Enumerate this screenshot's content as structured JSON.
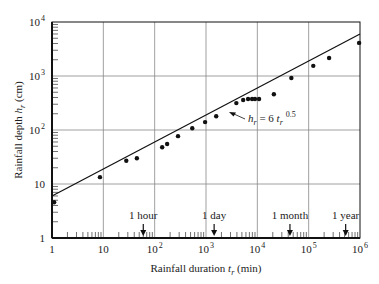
{
  "chart_data": {
    "type": "scatter",
    "title": "",
    "xlabel": "Rainfall duration t_r (min)",
    "ylabel": "Rainfall depth h_r (cm)",
    "xscale": "log",
    "yscale": "log",
    "xlim": [
      1,
      1000000
    ],
    "ylim": [
      1,
      10000
    ],
    "grid": true,
    "x_tick_labels": [
      "1",
      "10",
      "10^2",
      "10^3",
      "10^4",
      "10^5",
      "10^6"
    ],
    "y_tick_labels": [
      "1",
      "10",
      "10^2",
      "10^3",
      "10^4"
    ],
    "series": [
      {
        "name": "Observed maximum rainfall",
        "kind": "points",
        "x": [
          1.1,
          8.6,
          28,
          45,
          140,
          175,
          285,
          540,
          960,
          1580,
          3900,
          5300,
          6600,
          7900,
          9000,
          10800,
          21000,
          46000,
          123000,
          250000,
          960000
        ],
        "y": [
          4.6,
          13.4,
          27,
          30,
          48,
          55,
          77,
          108,
          140,
          180,
          315,
          360,
          375,
          375,
          375,
          375,
          460,
          920,
          1540,
          2150,
          4100
        ]
      },
      {
        "name": "h_r = 6 t_r^0.5",
        "kind": "line",
        "equation": "h_r = 6 t_r^0.5",
        "coefficient": 6,
        "exponent": 0.5,
        "x": [
          1,
          1000000
        ],
        "y": [
          6,
          6000
        ]
      }
    ],
    "annotations": [
      {
        "text": "h_r = 6 t_r 0.5",
        "type": "line-label",
        "x": 2000,
        "y": 120
      },
      {
        "text": "1 hour",
        "type": "arrow-marker",
        "x": 60
      },
      {
        "text": "1 day",
        "type": "arrow-marker",
        "x": 1440
      },
      {
        "text": "1 month",
        "type": "arrow-marker",
        "x": 43200
      },
      {
        "text": "1 year",
        "type": "arrow-marker",
        "x": 525600
      }
    ]
  },
  "labels": {
    "x_axis_prefix": "Rainfall duration ",
    "x_axis_var": "t",
    "x_axis_sub": "r",
    "x_axis_unit": " (min)",
    "y_axis_prefix": "Rainfall depth ",
    "y_axis_var": "h",
    "y_axis_sub": "r",
    "y_axis_unit": " (cm)",
    "equation_h": "h",
    "equation_sub_r": "r",
    "equation_mid": " = 6 ",
    "equation_t": "t",
    "equation_exp": "0.5"
  }
}
